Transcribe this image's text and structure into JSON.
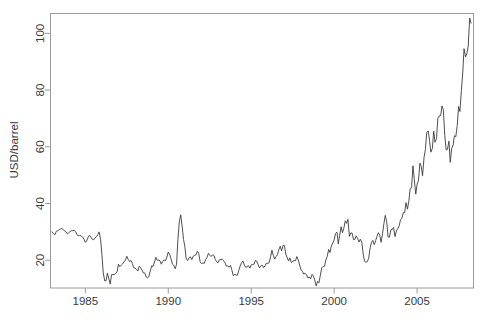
{
  "chart_data": {
    "type": "line",
    "title": "",
    "subtitle": "",
    "xlabel": "",
    "ylabel": "USD/barrel",
    "xlim": [
      1982.9,
      2008.4
    ],
    "ylim": [
      10.2,
      107.0
    ],
    "xticks": [
      1985,
      1990,
      1995,
      2000,
      2005
    ],
    "xtick_labels": [
      "1985",
      "1990",
      "1995",
      "2000",
      "2005"
    ],
    "yticks": [
      20,
      40,
      60,
      80,
      100
    ],
    "ytick_labels": [
      "20",
      "40",
      "60",
      "80",
      "100"
    ],
    "grid": false,
    "legend": false,
    "legend_position": "none",
    "box": true,
    "line_color": "#3b3b3b",
    "axis_color": "#9a9a9a",
    "background_color": "#ffffff",
    "series": [
      {
        "name": "Crude oil price",
        "units": "USD/barrel",
        "x": [
          1983.0,
          1983.08,
          1983.17,
          1983.25,
          1983.33,
          1983.42,
          1983.5,
          1983.58,
          1983.67,
          1983.75,
          1983.83,
          1983.92,
          1984.0,
          1984.08,
          1984.17,
          1984.25,
          1984.33,
          1984.42,
          1984.5,
          1984.58,
          1984.67,
          1984.75,
          1984.83,
          1984.92,
          1985.0,
          1985.08,
          1985.17,
          1985.25,
          1985.33,
          1985.42,
          1985.5,
          1985.58,
          1985.67,
          1985.75,
          1985.83,
          1985.92,
          1986.0,
          1986.08,
          1986.17,
          1986.25,
          1986.33,
          1986.42,
          1986.5,
          1986.58,
          1986.67,
          1986.75,
          1986.83,
          1986.92,
          1987.0,
          1987.08,
          1987.17,
          1987.25,
          1987.33,
          1987.42,
          1987.5,
          1987.58,
          1987.67,
          1987.75,
          1987.83,
          1987.92,
          1988.0,
          1988.08,
          1988.17,
          1988.25,
          1988.33,
          1988.42,
          1988.5,
          1988.58,
          1988.67,
          1988.75,
          1988.83,
          1988.92,
          1989.0,
          1989.08,
          1989.17,
          1989.25,
          1989.33,
          1989.42,
          1989.5,
          1989.58,
          1989.67,
          1989.75,
          1989.83,
          1989.92,
          1990.0,
          1990.08,
          1990.17,
          1990.25,
          1990.33,
          1990.42,
          1990.5,
          1990.58,
          1990.67,
          1990.75,
          1990.83,
          1990.92,
          1991.0,
          1991.08,
          1991.17,
          1991.25,
          1991.33,
          1991.42,
          1991.5,
          1991.58,
          1991.67,
          1991.75,
          1991.83,
          1991.92,
          1992.0,
          1992.08,
          1992.17,
          1992.25,
          1992.33,
          1992.42,
          1992.5,
          1992.58,
          1992.67,
          1992.75,
          1992.83,
          1992.92,
          1993.0,
          1993.08,
          1993.17,
          1993.25,
          1993.33,
          1993.42,
          1993.5,
          1993.58,
          1993.67,
          1993.75,
          1993.83,
          1993.92,
          1994.0,
          1994.08,
          1994.17,
          1994.25,
          1994.33,
          1994.42,
          1994.5,
          1994.58,
          1994.67,
          1994.75,
          1994.83,
          1994.92,
          1995.0,
          1995.08,
          1995.17,
          1995.25,
          1995.33,
          1995.42,
          1995.5,
          1995.58,
          1995.67,
          1995.75,
          1995.83,
          1995.92,
          1996.0,
          1996.08,
          1996.17,
          1996.25,
          1996.33,
          1996.42,
          1996.5,
          1996.58,
          1996.67,
          1996.75,
          1996.83,
          1996.92,
          1997.0,
          1997.08,
          1997.17,
          1997.25,
          1997.33,
          1997.42,
          1997.5,
          1997.58,
          1997.67,
          1997.75,
          1997.83,
          1997.92,
          1998.0,
          1998.08,
          1998.17,
          1998.25,
          1998.33,
          1998.42,
          1998.5,
          1998.58,
          1998.67,
          1998.75,
          1998.83,
          1998.92,
          1999.0,
          1999.08,
          1999.17,
          1999.25,
          1999.33,
          1999.42,
          1999.5,
          1999.58,
          1999.67,
          1999.75,
          1999.83,
          1999.92,
          2000.0,
          2000.08,
          2000.17,
          2000.25,
          2000.33,
          2000.42,
          2000.5,
          2000.58,
          2000.67,
          2000.75,
          2000.83,
          2000.92,
          2001.0,
          2001.08,
          2001.17,
          2001.25,
          2001.33,
          2001.42,
          2001.5,
          2001.58,
          2001.67,
          2001.75,
          2001.83,
          2001.92,
          2002.0,
          2002.08,
          2002.17,
          2002.25,
          2002.33,
          2002.42,
          2002.5,
          2002.58,
          2002.67,
          2002.75,
          2002.83,
          2002.92,
          2003.0,
          2003.08,
          2003.17,
          2003.25,
          2003.33,
          2003.42,
          2003.5,
          2003.58,
          2003.67,
          2003.75,
          2003.83,
          2003.92,
          2004.0,
          2004.08,
          2004.17,
          2004.25,
          2004.33,
          2004.42,
          2004.5,
          2004.58,
          2004.67,
          2004.75,
          2004.83,
          2004.92,
          2005.0,
          2005.08,
          2005.17,
          2005.25,
          2005.33,
          2005.42,
          2005.5,
          2005.58,
          2005.67,
          2005.75,
          2005.83,
          2005.92,
          2006.0,
          2006.08,
          2006.17,
          2006.25,
          2006.33,
          2006.42,
          2006.5,
          2006.58,
          2006.67,
          2006.75,
          2006.83,
          2006.92,
          2007.0,
          2007.08,
          2007.17,
          2007.25,
          2007.33,
          2007.42,
          2007.5,
          2007.58,
          2007.67,
          2007.75,
          2007.83,
          2007.92,
          2008.0,
          2008.08,
          2008.17,
          2008.25
        ],
        "values": [
          30.0,
          29.3,
          29.0,
          30.2,
          30.4,
          30.7,
          31.0,
          31.2,
          30.8,
          30.3,
          30.0,
          29.3,
          29.7,
          30.1,
          30.4,
          30.4,
          30.6,
          30.0,
          29.0,
          28.6,
          28.8,
          28.5,
          28.2,
          27.4,
          26.3,
          26.8,
          28.1,
          28.8,
          28.2,
          27.4,
          27.2,
          27.8,
          28.3,
          29.0,
          30.0,
          27.3,
          22.0,
          15.5,
          12.7,
          12.8,
          15.4,
          13.4,
          11.6,
          14.9,
          15.0,
          14.9,
          15.3,
          16.1,
          18.6,
          17.7,
          18.3,
          18.7,
          19.4,
          20.1,
          21.4,
          20.3,
          19.5,
          19.9,
          18.9,
          17.3,
          17.2,
          16.8,
          16.2,
          17.9,
          17.4,
          16.5,
          15.5,
          15.5,
          14.1,
          13.8,
          14.2,
          16.3,
          18.0,
          17.8,
          19.4,
          21.0,
          20.0,
          20.0,
          19.8,
          18.6,
          19.6,
          20.1,
          19.8,
          21.1,
          22.9,
          22.1,
          20.4,
          18.6,
          18.2,
          17.0,
          18.6,
          27.3,
          33.7,
          36.0,
          32.3,
          27.3,
          24.8,
          20.5,
          19.9,
          20.8,
          21.2,
          20.2,
          21.4,
          21.7,
          21.9,
          23.2,
          22.5,
          19.5,
          18.8,
          19.0,
          18.9,
          20.2,
          20.9,
          22.4,
          21.8,
          21.3,
          21.9,
          21.7,
          20.3,
          19.4,
          19.1,
          20.1,
          20.3,
          20.3,
          19.9,
          19.1,
          17.9,
          18.0,
          17.5,
          18.2,
          16.6,
          14.5,
          15.0,
          14.8,
          14.7,
          16.4,
          17.9,
          19.1,
          19.7,
          18.4,
          17.5,
          17.7,
          18.1,
          17.2,
          18.4,
          18.5,
          18.6,
          19.9,
          19.7,
          18.4,
          17.3,
          18.0,
          18.2,
          17.4,
          18.0,
          19.0,
          18.9,
          19.1,
          21.3,
          23.5,
          21.7,
          20.4,
          21.3,
          22.0,
          23.8,
          24.9,
          23.3,
          25.2,
          25.2,
          22.2,
          20.9,
          19.7,
          20.8,
          19.2,
          19.6,
          19.9,
          19.8,
          21.3,
          20.2,
          18.3,
          16.7,
          16.1,
          15.1,
          15.4,
          14.9,
          13.7,
          14.1,
          13.4,
          15.0,
          14.4,
          13.0,
          10.9,
          12.5,
          12.0,
          14.7,
          17.3,
          17.8,
          17.9,
          20.1,
          21.3,
          23.8,
          22.7,
          25.0,
          26.1,
          27.2,
          29.4,
          29.9,
          25.7,
          28.8,
          31.8,
          29.7,
          31.2,
          33.9,
          33.0,
          34.4,
          28.4,
          29.6,
          29.6,
          27.2,
          27.4,
          28.6,
          27.6,
          26.4,
          27.4,
          26.2,
          22.2,
          19.6,
          19.3,
          19.5,
          20.7,
          24.4,
          26.3,
          27.0,
          25.5,
          26.9,
          28.4,
          29.7,
          28.8,
          26.3,
          29.5,
          32.9,
          35.8,
          33.5,
          28.2,
          28.1,
          30.7,
          30.8,
          31.6,
          28.3,
          30.3,
          31.1,
          32.1,
          34.3,
          34.7,
          36.8,
          36.7,
          40.3,
          38.0,
          40.8,
          44.9,
          45.9,
          53.3,
          48.5,
          43.3,
          46.8,
          48.0,
          54.2,
          53.0,
          49.8,
          56.4,
          59.0,
          65.0,
          65.6,
          62.3,
          58.1,
          59.4,
          65.5,
          61.6,
          62.9,
          70.0,
          70.9,
          71.0,
          74.4,
          73.1,
          63.9,
          58.9,
          59.1,
          62.0,
          54.5,
          59.3,
          60.6,
          63.9,
          63.5,
          67.5,
          74.2,
          72.4,
          79.9,
          86.0,
          94.6,
          91.7,
          92.9,
          95.4,
          105.4,
          103.6
        ]
      }
    ]
  },
  "axes": {
    "y_title": "USD/barrel",
    "y_labels": [
      "100",
      "80",
      "60",
      "40",
      "20"
    ],
    "x_labels": [
      "1985",
      "1990",
      "1995",
      "2000",
      "2005"
    ]
  }
}
